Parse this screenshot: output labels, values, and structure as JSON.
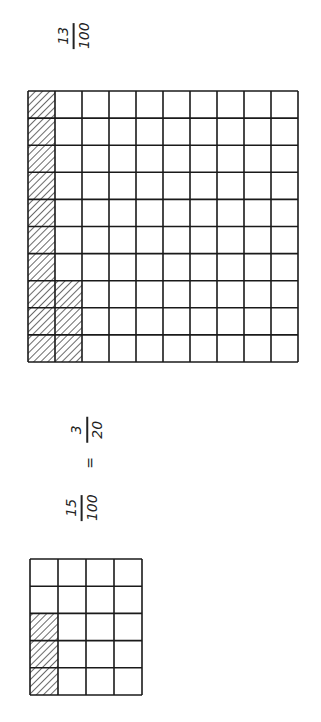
{
  "colors": {
    "line": "#1a1a1a",
    "hatch": "#1a1a1a",
    "background": "#ffffff"
  },
  "large_grid": {
    "columns": 10,
    "rows": 10,
    "shaded_cells": 13,
    "shaded_pattern": "first column full (10 cells) + 3 cells of second column at bottom",
    "shaded": [
      {
        "col": 0,
        "rows": [
          0,
          1,
          2,
          3,
          4,
          5,
          6,
          7,
          8,
          9
        ]
      },
      {
        "col": 1,
        "rows": [
          7,
          8,
          9
        ]
      }
    ],
    "fraction": {
      "numerator": "13",
      "denominator": "100"
    }
  },
  "small_grid": {
    "columns": 4,
    "rows": 5,
    "shaded_cells": 3,
    "shaded": [
      {
        "col": 0,
        "rows": [
          2,
          3,
          4
        ]
      }
    ],
    "equation": {
      "left": {
        "numerator": "15",
        "denominator": "100"
      },
      "equals": "=",
      "right": {
        "numerator": "3",
        "denominator": "20"
      }
    }
  }
}
